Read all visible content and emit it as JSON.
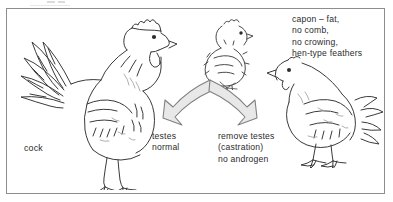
{
  "figure": {
    "frame_color": "#8d8d8d",
    "background_color": "#ffffff",
    "ink_color": "#3a3a3a",
    "text_color": "#2b2b2b",
    "arrow_fill_color": "#e8e8e8",
    "arrow_outline_color": "#808080"
  },
  "captions": {
    "cock": "cock",
    "capon": "capon – fat,\nno comb,\nno crowing,\nhen-type feathers",
    "left_branch": "testes\nnormal",
    "right_branch": "remove testes\n(castration)\nno androgen"
  },
  "illustrations": {
    "cock": "cock-line-drawing",
    "chick": "chick-line-drawing",
    "capon": "capon-line-drawing",
    "arrow_left": "curved-arrow-left-icon",
    "arrow_right": "curved-arrow-right-icon"
  }
}
